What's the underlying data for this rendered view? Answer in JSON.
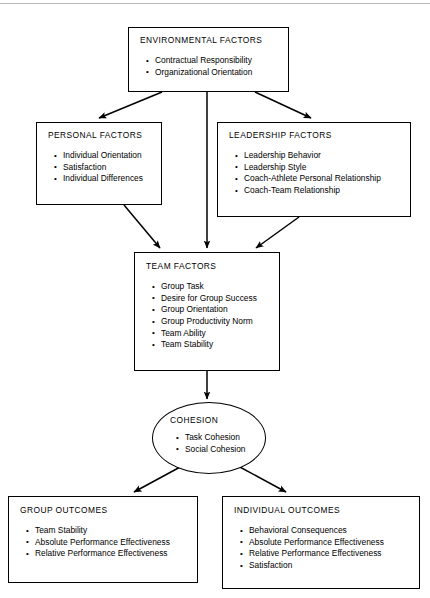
{
  "diagram": {
    "type": "flowchart",
    "colors": {
      "stroke": "#000000",
      "fill": "#ffffff",
      "text": "#000000"
    },
    "nodes": [
      {
        "id": "environmental",
        "shape": "rectangle",
        "title": "ENVIRONMENTAL FACTORS",
        "items": [
          "Contractual Responsibility",
          "Organizational Orientation"
        ]
      },
      {
        "id": "personal",
        "shape": "rectangle",
        "title": "PERSONAL FACTORS",
        "items": [
          "Individual Orientation",
          "Satisfaction",
          "Individual Differences"
        ]
      },
      {
        "id": "leadership",
        "shape": "rectangle",
        "title": "LEADERSHIP FACTORS",
        "items": [
          "Leadership Behavior",
          "Leadership Style",
          "Coach-Athlete Personal Relationship",
          "Coach-Team Relationship"
        ]
      },
      {
        "id": "team",
        "shape": "rectangle",
        "title": "TEAM FACTORS",
        "items": [
          "Group Task",
          "Desire for Group Success",
          "Group Orientation",
          "Group Productivity Norm",
          "Team Ability",
          "Team Stability"
        ]
      },
      {
        "id": "cohesion",
        "shape": "ellipse",
        "title": "COHESION",
        "items": [
          "Task Cohesion",
          "Social Cohesion"
        ]
      },
      {
        "id": "group-outcomes",
        "shape": "rectangle",
        "title": "GROUP OUTCOMES",
        "items": [
          "Team Stability",
          "Absolute Performance Effectiveness",
          "Relative Performance Effectiveness"
        ]
      },
      {
        "id": "individual-outcomes",
        "shape": "rectangle",
        "title": "INDIVIDUAL OUTCOMES",
        "items": [
          "Behavioral Consequences",
          "Absolute Performance Effectiveness",
          "Relative Performance Effectiveness",
          "Satisfaction"
        ]
      }
    ],
    "edges": [
      {
        "from": "environmental",
        "to": "personal",
        "style": "arrow"
      },
      {
        "from": "environmental",
        "to": "team",
        "style": "arrow"
      },
      {
        "from": "environmental",
        "to": "leadership",
        "style": "arrow"
      },
      {
        "from": "personal",
        "to": "team",
        "style": "arrow"
      },
      {
        "from": "leadership",
        "to": "team",
        "style": "arrow"
      },
      {
        "from": "team",
        "to": "cohesion",
        "style": "arrow"
      },
      {
        "from": "cohesion",
        "to": "group-outcomes",
        "style": "arrow"
      },
      {
        "from": "cohesion",
        "to": "individual-outcomes",
        "style": "arrow"
      }
    ]
  }
}
